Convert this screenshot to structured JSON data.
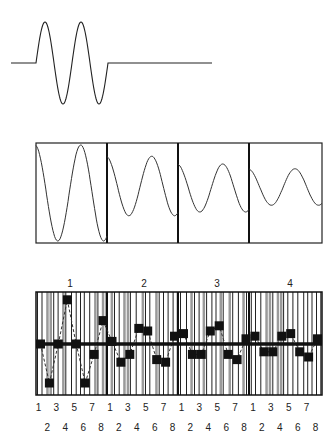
{
  "colors": {
    "ink": "#222222",
    "bar_gray": "#9a9a9a",
    "background": "#ffffff"
  },
  "top_panel": {
    "description": "Burst waveform: two sine cycles between flat baselines",
    "cycles": 2
  },
  "middle_panel": {
    "description": "Damped oscillation split into four frames",
    "frame_count": 4,
    "amplitudes": [
      1.0,
      0.62,
      0.5,
      0.38
    ]
  },
  "bottom_panel": {
    "description": "Sampled signal with square markers over barcode-like striped background, thick horizontal zero line",
    "group_labels": [
      "1",
      "2",
      "3",
      "4"
    ],
    "odd_ticks": [
      "1",
      "3",
      "5",
      "7",
      "1",
      "3",
      "5",
      "7",
      "1",
      "3",
      "5",
      "7",
      "1",
      "3",
      "5",
      "7"
    ],
    "even_ticks": [
      "2",
      "4",
      "6",
      "8",
      "2",
      "4",
      "6",
      "8",
      "2",
      "4",
      "6",
      "8",
      "2",
      "4",
      "6",
      "8"
    ],
    "samples": [
      0.0,
      -0.75,
      0.0,
      0.85,
      0.0,
      -0.75,
      -0.2,
      0.45,
      0.05,
      -0.35,
      -0.2,
      0.3,
      0.25,
      -0.3,
      -0.35,
      0.15,
      0.2,
      -0.2,
      -0.2,
      0.25,
      0.35,
      -0.2,
      -0.3,
      0.1,
      0.15,
      -0.15,
      -0.15,
      0.15,
      0.2,
      -0.15,
      -0.25,
      0.1
    ]
  }
}
